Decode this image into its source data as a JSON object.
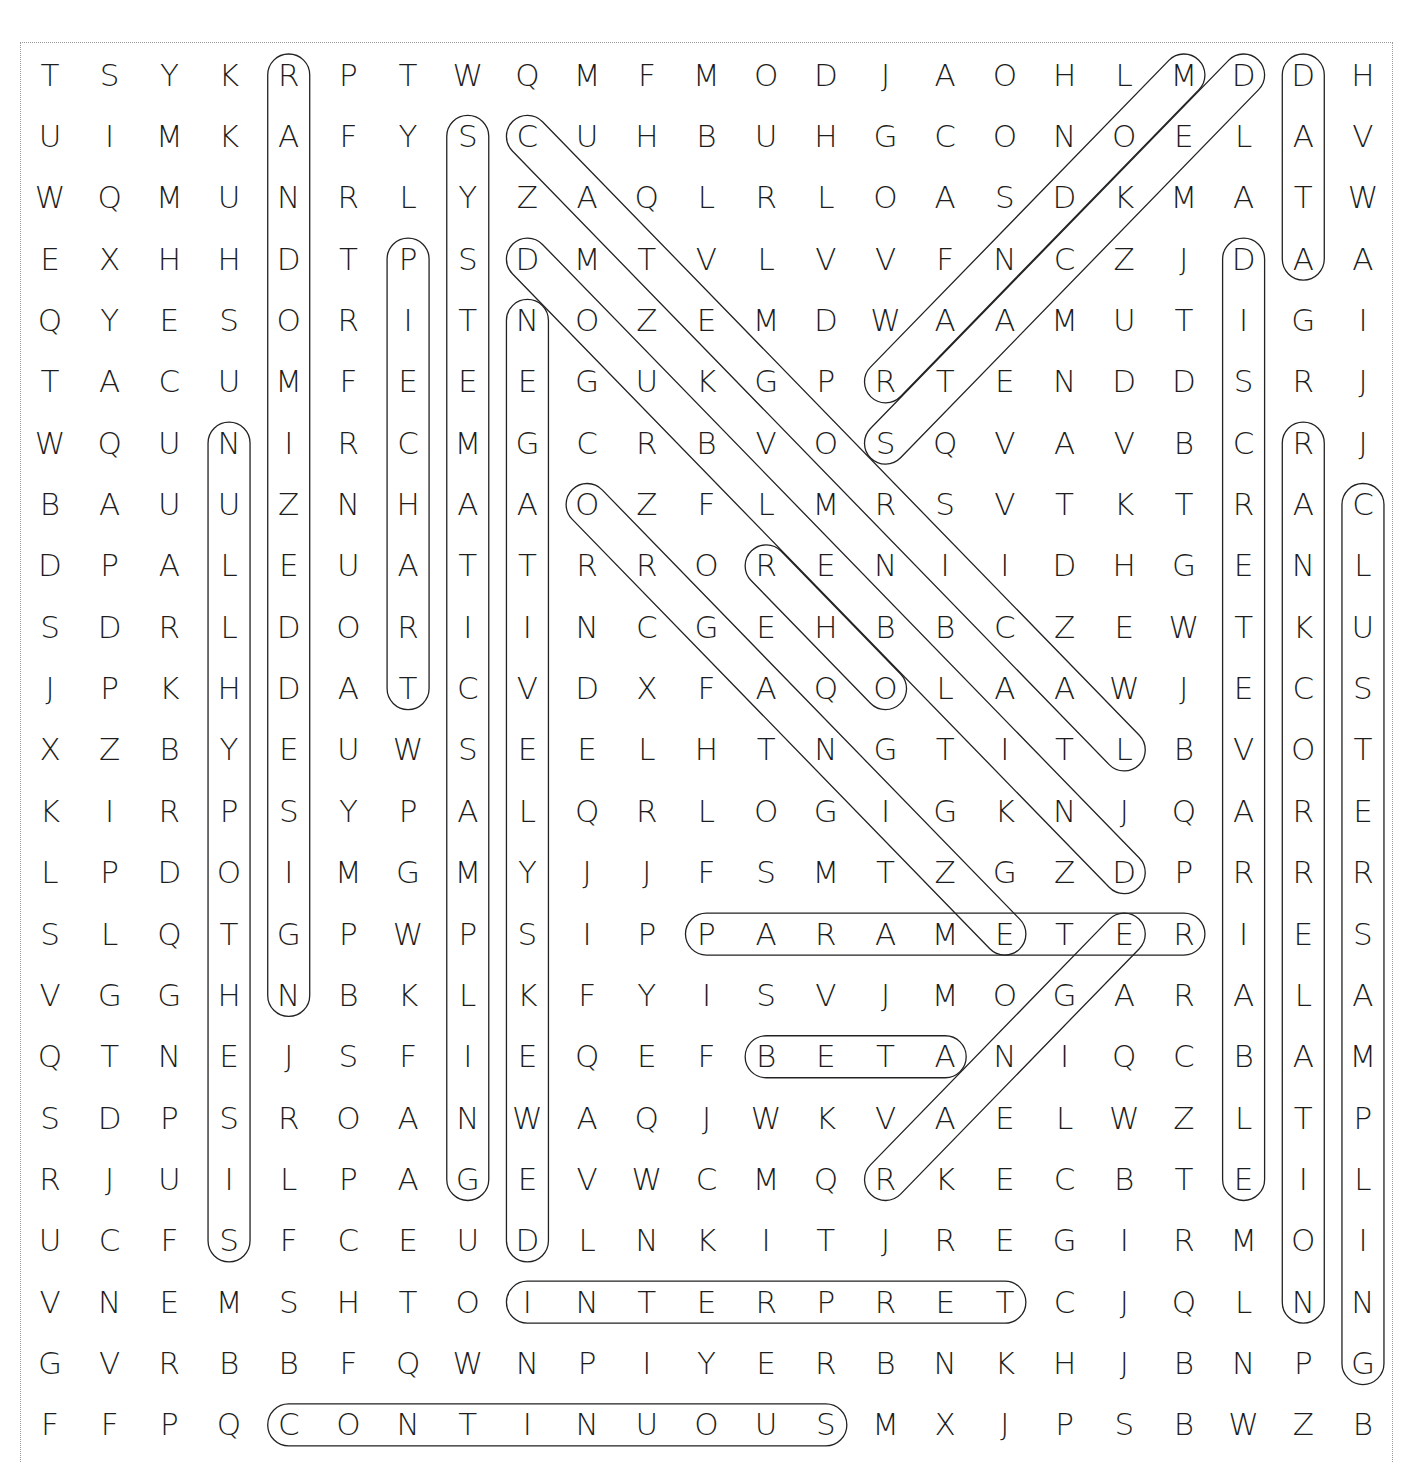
{
  "puzzle": {
    "type": "word-search",
    "rows": 23,
    "cols": 23,
    "grid": [
      "TSYKRPTWQMFMODJAOHLMDDH",
      "UIMKAFYSCUHBUHGCONOELAV",
      "WQMUNRLYZAQLRLOASDKMATW",
      "EXHHDTPSDMTVLVVFNCZJDAA",
      "QYESORITNOZEMDWAAMUTIGI",
      "TACUMFEEEGUKGPRTENDDSRJ",
      "WQUNIRCMGCRBVOSQVAVBCRJ",
      "BAUUZNHAAOZFLMRSVTKTRAC",
      "DPALEUATTRRORENIIDHGENL",
      "SDRLDORIINCGEHBBCZEWTKU",
      "JPKHDATCVDXFAQOLAAWJECS",
      "XZBYEUWSEELHTNGTITLBVOT",
      "KIRPSYPALQRLOGIGKNJQARE",
      "LPDOIMGMYJJFSMTZGZDPRRR",
      "SLQTGPWPSIPPARAMETERIES",
      "VGGHNBKLKFYISVJMOGARALA",
      "QTNEJSFIEQEFBETANIQCBAM",
      "SDPSROANWAQJWKVAELWZLTP",
      "RJUILPAGEVWCMQRKECBTEIL",
      "UCFSFCEUDLNKITJREGIRMOI",
      "VNEMSHTOINTERPRETCJQLNN",
      "GVRBBFQWNPIYERBNKHJBNPG",
      "FFPQCONTINUOUSMXJPSBWZB"
    ]
  },
  "found_words": [
    {
      "word": "RANDOMIZED DESIGN",
      "start": [
        0,
        4
      ],
      "end": [
        15,
        4
      ]
    },
    {
      "word": "SYSTEMATIC SAMPLING",
      "start": [
        1,
        7
      ],
      "end": [
        18,
        7
      ]
    },
    {
      "word": "PIE CHART",
      "start": [
        3,
        6
      ],
      "end": [
        10,
        6
      ]
    },
    {
      "word": "NEGATIVELY SKEWED",
      "start": [
        4,
        8
      ],
      "end": [
        19,
        8
      ]
    },
    {
      "word": "NULL HYPOTHESIS",
      "start": [
        6,
        3
      ],
      "end": [
        19,
        3
      ]
    },
    {
      "word": "DATA",
      "start": [
        0,
        21
      ],
      "end": [
        3,
        21
      ]
    },
    {
      "word": "DISCRETE VARIABLE",
      "start": [
        3,
        20
      ],
      "end": [
        18,
        20
      ]
    },
    {
      "word": "RANK CORRELATION",
      "start": [
        6,
        21
      ],
      "end": [
        20,
        21
      ]
    },
    {
      "word": "CLUSTER SAMPLING",
      "start": [
        7,
        22
      ],
      "end": [
        21,
        22
      ]
    },
    {
      "word": "PARAMETER",
      "start": [
        14,
        11
      ],
      "end": [
        14,
        19
      ]
    },
    {
      "word": "BETA",
      "start": [
        16,
        12
      ],
      "end": [
        16,
        15
      ]
    },
    {
      "word": "INTERPRET",
      "start": [
        20,
        8
      ],
      "end": [
        20,
        16
      ]
    },
    {
      "word": "CONTINUOUS",
      "start": [
        22,
        4
      ],
      "end": [
        22,
        13
      ]
    },
    {
      "word": "CATEGORICAL",
      "start": [
        1,
        8
      ],
      "end": [
        11,
        18
      ]
    },
    {
      "word": "DOUBLE BLIND",
      "start": [
        3,
        8
      ],
      "end": [
        13,
        18
      ]
    },
    {
      "word": "ORGANIZE",
      "start": [
        7,
        9
      ],
      "end": [
        14,
        16
      ]
    },
    {
      "word": "RHO",
      "start": [
        8,
        12
      ],
      "end": [
        10,
        14
      ]
    },
    {
      "word": "RANDOM",
      "start": [
        5,
        14
      ],
      "end": [
        0,
        19
      ]
    },
    {
      "word": "STACKED",
      "start": [
        6,
        14
      ],
      "end": [
        0,
        20
      ]
    },
    {
      "word": "RANGE",
      "start": [
        18,
        14
      ],
      "end": [
        14,
        18
      ]
    }
  ],
  "style": {
    "letter_color": "#1e1e1e",
    "loop_color": "#222222",
    "frame_color": "#9a9a9a",
    "background": "#ffffff"
  }
}
